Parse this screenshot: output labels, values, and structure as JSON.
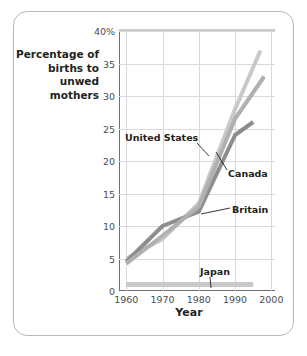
{
  "axis": {
    "ylabel": "Percentage of births to unwed mothers",
    "xlabel": "Year",
    "yticks": [
      "0",
      "5",
      "10",
      "15",
      "20",
      "25",
      "30",
      "35",
      "40%"
    ],
    "xticks": [
      "1960",
      "1970",
      "1980",
      "1990",
      "2000"
    ]
  },
  "annotations": {
    "united_states": "United States",
    "canada": "Canada",
    "britain": "Britain",
    "japan": "Japan"
  },
  "colors": {
    "united_states": "#c9c9c9",
    "canada": "#8d8d8d",
    "britain": "#b0b0b0",
    "japan": "#c9c9c9",
    "grid": "#d9d9dd",
    "axis": "#6d6e71",
    "card_border": "#b8b8b8",
    "text": "#231f20"
  },
  "chart_data": {
    "type": "line",
    "title": "",
    "xlabel": "Year",
    "ylabel": "Percentage of births to unwed mothers",
    "xlim": [
      1958,
      2001
    ],
    "ylim": [
      0,
      40
    ],
    "yticks": [
      0,
      5,
      10,
      15,
      20,
      25,
      30,
      35,
      40
    ],
    "xticks": [
      1960,
      1970,
      1980,
      1990,
      2000
    ],
    "grid": true,
    "legend": "inline-annotations",
    "series": [
      {
        "name": "United States",
        "color": "#c9c9c9",
        "x": [
          1960,
          1970,
          1980,
          1990,
          1997
        ],
        "values": [
          5.0,
          8.0,
          13.5,
          28.0,
          37.0
        ]
      },
      {
        "name": "Canada",
        "color": "#8d8d8d",
        "x": [
          1960,
          1970,
          1980,
          1990,
          1995
        ],
        "values": [
          4.5,
          10.0,
          12.2,
          24.0,
          26.0
        ]
      },
      {
        "name": "Britain",
        "color": "#b0b0b0",
        "x": [
          1960,
          1970,
          1980,
          1990,
          1998
        ],
        "values": [
          4.2,
          8.5,
          13.0,
          26.5,
          33.0
        ]
      },
      {
        "name": "Japan",
        "color": "#c9c9c9",
        "x": [
          1960,
          1995
        ],
        "values": [
          1.0,
          1.0
        ]
      }
    ]
  }
}
